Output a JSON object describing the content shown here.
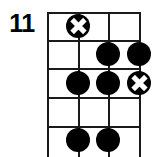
{
  "diagram": {
    "kind": "guitar-chord-diagram",
    "fret_position_label": "11",
    "grid": {
      "string_count": 4,
      "fret_count": 5,
      "string_x": [
        0,
        31,
        61,
        92
      ],
      "fret_y": [
        0,
        28,
        56,
        85,
        114
      ],
      "grid_left": 47,
      "grid_top": 12,
      "grid_width": 92,
      "grid_height": 145,
      "line_color": "#1a1a1a"
    },
    "markers": [
      {
        "name": "marker-x-string2-fret1",
        "type": "x",
        "string": 2,
        "fret": 1,
        "x": 31,
        "y": 14,
        "color": "#000000"
      },
      {
        "name": "marker-dot-string3-fret2",
        "type": "dot",
        "string": 3,
        "fret": 2,
        "x": 61,
        "y": 42,
        "color": "#000000"
      },
      {
        "name": "marker-dot-string4-fret2",
        "type": "dot",
        "string": 4,
        "fret": 2,
        "x": 92,
        "y": 42,
        "color": "#000000"
      },
      {
        "name": "marker-dot-string2-fret3",
        "type": "dot",
        "string": 2,
        "fret": 3,
        "x": 31,
        "y": 71,
        "color": "#000000"
      },
      {
        "name": "marker-dot-string3-fret3",
        "type": "dot",
        "string": 3,
        "fret": 3,
        "x": 61,
        "y": 71,
        "color": "#000000"
      },
      {
        "name": "marker-x-string4-fret3",
        "type": "x",
        "string": 4,
        "fret": 3,
        "x": 92,
        "y": 71,
        "color": "#000000"
      },
      {
        "name": "marker-dot-string2-fret5",
        "type": "dot",
        "string": 2,
        "fret": 5,
        "x": 31,
        "y": 128,
        "color": "#000000"
      },
      {
        "name": "marker-dot-string3-fret5",
        "type": "dot",
        "string": 3,
        "fret": 5,
        "x": 61,
        "y": 128,
        "color": "#000000"
      }
    ]
  }
}
